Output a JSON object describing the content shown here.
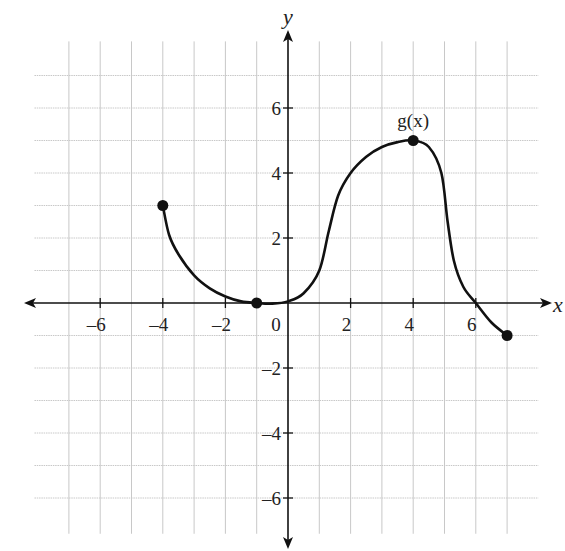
{
  "chart_data": {
    "type": "line",
    "title": "",
    "xlabel": "x",
    "ylabel": "y",
    "xlim": [
      -8,
      8
    ],
    "ylim": [
      -7,
      8
    ],
    "grid": true,
    "x_ticks": [
      -6,
      -4,
      -2,
      0,
      2,
      4,
      6
    ],
    "x_tick_labels": [
      "–6",
      "–4",
      "–2",
      "0",
      "2",
      "4",
      "6"
    ],
    "y_ticks": [
      -6,
      -4,
      -2,
      2,
      4,
      6
    ],
    "y_tick_labels": [
      "–6",
      "–4",
      "–2",
      "2",
      "4",
      "6"
    ],
    "series": [
      {
        "name": "g(x)",
        "label_position": [
          4,
          5.6
        ],
        "points": [
          [
            -4,
            3
          ],
          [
            -3.8,
            2.1
          ],
          [
            -3.5,
            1.5
          ],
          [
            -3,
            0.85
          ],
          [
            -2.5,
            0.45
          ],
          [
            -2,
            0.2
          ],
          [
            -1.5,
            0.05
          ],
          [
            -1,
            0
          ],
          [
            -0.5,
            -0.02
          ],
          [
            0,
            0.05
          ],
          [
            0.5,
            0.3
          ],
          [
            1,
            1
          ],
          [
            1.3,
            2.2
          ],
          [
            1.6,
            3.3
          ],
          [
            2,
            4
          ],
          [
            2.5,
            4.5
          ],
          [
            3,
            4.8
          ],
          [
            3.5,
            4.95
          ],
          [
            4,
            5
          ],
          [
            4.5,
            4.8
          ],
          [
            4.9,
            4.0
          ],
          [
            5.1,
            2.5
          ],
          [
            5.3,
            1.3
          ],
          [
            5.6,
            0.5
          ],
          [
            6,
            0
          ],
          [
            6.5,
            -0.6
          ],
          [
            7,
            -1
          ]
        ],
        "marked_points": [
          [
            -4,
            3
          ],
          [
            -1,
            0
          ],
          [
            4,
            5
          ],
          [
            7,
            -1
          ]
        ]
      }
    ],
    "legend": "none"
  },
  "labels": {
    "x_axis": "x",
    "y_axis": "y",
    "function": "g(x)"
  },
  "colors": {
    "curve": "#111111",
    "grid": "#c8c8c8",
    "axis": "#111111"
  }
}
